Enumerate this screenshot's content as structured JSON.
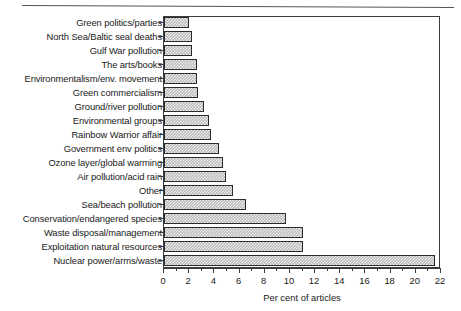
{
  "chart_data": {
    "type": "bar",
    "orientation": "horizontal",
    "title": "",
    "xlabel": "Per cent of articles",
    "ylabel": "",
    "xlim": [
      0,
      22
    ],
    "xticks": [
      0,
      2,
      4,
      6,
      8,
      10,
      12,
      14,
      16,
      18,
      20,
      22
    ],
    "xtick_labels": [
      "0",
      "2",
      "4",
      "6",
      "8",
      "10",
      "12",
      "14",
      "16",
      "18",
      "20",
      "22"
    ],
    "minor_tick_step": 1,
    "grid": false,
    "legend": null,
    "bar_style": {
      "fill_pattern": "fine-checkered-hatch",
      "fill_color": "#b9b9b9",
      "edge_color": "#2b2b2b"
    },
    "categories": [
      "Green politics/parties",
      "North Sea/Baltic seal deaths",
      "Gulf War pollution",
      "The arts/books",
      "Environmentalism/env. movement",
      "Green commercialism",
      "Ground/river pollution",
      "Environmental groups",
      "Rainbow Warrior affair",
      "Government env politics",
      "Ozone layer/global warming",
      "Air pollution/acid rain",
      "Other",
      "Sea/beach pollution",
      "Conservation/endangered species",
      "Waste disposal/management",
      "Exploitation natural resources",
      "Nuclear power/arms/waste"
    ],
    "values": [
      2.0,
      2.2,
      2.2,
      2.6,
      2.6,
      2.7,
      3.2,
      3.6,
      3.7,
      4.4,
      4.7,
      4.9,
      5.5,
      6.5,
      9.7,
      11.0,
      11.0,
      21.5
    ]
  }
}
